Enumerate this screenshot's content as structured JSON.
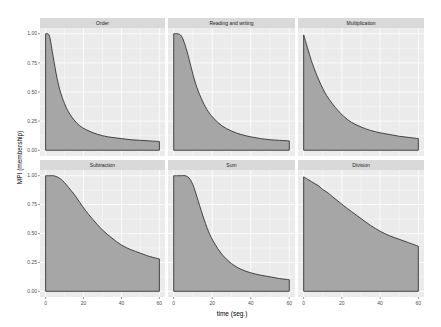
{
  "chart_data": {
    "type": "area",
    "layout": "facet_wrap 2x3",
    "xlabel": "time (seg.)",
    "ylabel": "MPI (membership)",
    "xlim": [
      0,
      60
    ],
    "ylim": [
      0,
      1
    ],
    "x_ticks": [
      "0",
      "20",
      "40",
      "60"
    ],
    "y_ticks": [
      "0.00",
      "0.25",
      "0.50",
      "0.75",
      "1.00"
    ],
    "grid": true,
    "fill_color": "#a6a6a6",
    "line_color": "#333333",
    "panel_bg": "#ebebeb",
    "strip_bg": "#d9d9d9",
    "x": [
      0,
      2,
      4,
      6,
      8,
      10,
      12,
      15,
      18,
      21,
      25,
      30,
      35,
      40,
      45,
      50,
      55,
      60
    ],
    "series": [
      {
        "name": "Order",
        "values": [
          1.0,
          0.98,
          0.8,
          0.62,
          0.49,
          0.4,
          0.33,
          0.26,
          0.21,
          0.18,
          0.15,
          0.125,
          0.11,
          0.1,
          0.09,
          0.085,
          0.08,
          0.075
        ]
      },
      {
        "name": "Reading and writing",
        "values": [
          1.0,
          1.0,
          0.98,
          0.9,
          0.78,
          0.65,
          0.54,
          0.42,
          0.33,
          0.27,
          0.21,
          0.165,
          0.135,
          0.115,
          0.1,
          0.09,
          0.085,
          0.08
        ]
      },
      {
        "name": "Multiplication",
        "values": [
          0.99,
          0.88,
          0.77,
          0.68,
          0.6,
          0.53,
          0.47,
          0.4,
          0.34,
          0.29,
          0.24,
          0.2,
          0.17,
          0.15,
          0.135,
          0.12,
          0.11,
          0.1
        ]
      },
      {
        "name": "Subtraction",
        "values": [
          1.0,
          1.0,
          1.0,
          0.99,
          0.97,
          0.94,
          0.9,
          0.84,
          0.77,
          0.7,
          0.62,
          0.53,
          0.46,
          0.4,
          0.36,
          0.33,
          0.3,
          0.28
        ]
      },
      {
        "name": "Sum",
        "values": [
          1.0,
          1.0,
          1.0,
          1.0,
          0.98,
          0.92,
          0.82,
          0.66,
          0.52,
          0.42,
          0.32,
          0.24,
          0.19,
          0.16,
          0.14,
          0.125,
          0.11,
          0.1
        ]
      },
      {
        "name": "Division",
        "values": [
          0.99,
          0.97,
          0.95,
          0.93,
          0.91,
          0.88,
          0.86,
          0.82,
          0.78,
          0.74,
          0.69,
          0.63,
          0.57,
          0.52,
          0.48,
          0.45,
          0.42,
          0.39
        ]
      }
    ]
  }
}
